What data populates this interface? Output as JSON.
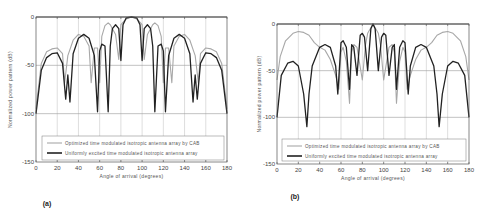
{
  "chart_data": [
    {
      "type": "line",
      "panel_label": "(a)",
      "title": "",
      "xlabel": "Angle of arrival (degrees)",
      "ylabel": "Normalized power pattern (dB)",
      "xlim": [
        0,
        180
      ],
      "ylim": [
        -150,
        0
      ],
      "xticks": [
        0,
        20,
        40,
        60,
        80,
        100,
        120,
        140,
        160,
        180
      ],
      "yticks": [
        0,
        -50,
        -100,
        -150
      ],
      "grid": true,
      "legend_position": "bottom",
      "series": [
        {
          "name": "Optimized time modulated isotropic antenna array by CAB",
          "color": "#a8a8a8",
          "x": [
            0,
            5,
            10,
            15,
            20,
            25,
            27,
            30,
            35,
            40,
            45,
            50,
            52,
            55,
            58,
            60,
            62,
            65,
            68,
            70,
            75,
            78,
            80,
            85,
            90,
            95,
            100,
            102,
            105,
            110,
            112,
            115,
            118,
            120,
            122,
            125,
            128,
            130,
            135,
            140,
            145,
            150,
            153,
            155,
            160,
            165,
            170,
            175,
            180
          ],
          "y": [
            -95,
            -48,
            -36,
            -33,
            -32,
            -38,
            -68,
            -40,
            -24,
            -18,
            -20,
            -30,
            -68,
            -32,
            -32,
            -68,
            -20,
            -9,
            -6,
            -8,
            -18,
            -44,
            -8,
            -2,
            0,
            -2,
            -8,
            -44,
            -18,
            -8,
            -6,
            -9,
            -20,
            -68,
            -32,
            -32,
            -68,
            -30,
            -20,
            -18,
            -24,
            -40,
            -68,
            -38,
            -32,
            -33,
            -36,
            -48,
            -95
          ]
        },
        {
          "name": "Uniformly excited time modulated isotropic antenna array",
          "color": "#222222",
          "x": [
            0,
            5,
            10,
            15,
            20,
            25,
            28,
            30,
            32,
            35,
            40,
            45,
            50,
            55,
            58,
            60,
            62,
            65,
            68,
            70,
            72,
            75,
            78,
            80,
            82,
            85,
            90,
            95,
            98,
            100,
            102,
            105,
            108,
            110,
            112,
            115,
            118,
            120,
            122,
            125,
            130,
            135,
            140,
            145,
            148,
            150,
            152,
            155,
            160,
            165,
            170,
            175,
            180
          ],
          "y": [
            -100,
            -55,
            -42,
            -38,
            -37,
            -48,
            -85,
            -60,
            -88,
            -38,
            -22,
            -18,
            -22,
            -40,
            -98,
            -35,
            -28,
            -30,
            -98,
            -30,
            -12,
            -8,
            -12,
            -45,
            -8,
            -1,
            0,
            -1,
            -8,
            -45,
            -12,
            -8,
            -12,
            -30,
            -98,
            -30,
            -28,
            -35,
            -98,
            -40,
            -22,
            -18,
            -22,
            -38,
            -88,
            -60,
            -85,
            -48,
            -37,
            -38,
            -42,
            -55,
            -100
          ]
        }
      ]
    },
    {
      "type": "line",
      "panel_label": "(b)",
      "title": "",
      "xlabel": "Angle of arrival (degrees)",
      "ylabel": "Normalized power pattern (dB)",
      "xlim": [
        0,
        180
      ],
      "ylim": [
        -150,
        0
      ],
      "xticks": [
        0,
        20,
        40,
        60,
        80,
        100,
        120,
        140,
        160,
        180
      ],
      "yticks": [
        0,
        -50,
        -100,
        -150
      ],
      "grid": true,
      "legend_position": "bottom",
      "series": [
        {
          "name": "Optimized time modulated isotropic antenna array by CAB",
          "color": "#a8a8a8",
          "x": [
            0,
            3,
            8,
            15,
            20,
            25,
            30,
            35,
            40,
            45,
            50,
            55,
            58,
            60,
            62,
            65,
            68,
            70,
            72,
            75,
            80,
            83,
            85,
            88,
            90,
            92,
            95,
            97,
            100,
            105,
            108,
            110,
            112,
            115,
            118,
            120,
            122,
            125,
            130,
            135,
            140,
            145,
            150,
            155,
            160,
            165,
            172,
            177,
            180
          ],
          "y": [
            -60,
            -35,
            -18,
            -10,
            -8,
            -9,
            -12,
            -20,
            -25,
            -28,
            -38,
            -55,
            -70,
            -30,
            -25,
            -40,
            -85,
            -30,
            -22,
            -25,
            -60,
            -22,
            -10,
            -4,
            0,
            -4,
            -10,
            -22,
            -60,
            -25,
            -22,
            -30,
            -85,
            -40,
            -25,
            -30,
            -70,
            -55,
            -38,
            -28,
            -25,
            -20,
            -12,
            -9,
            -8,
            -10,
            -18,
            -35,
            -60
          ]
        },
        {
          "name": "Uniformly excited time modulated isotropic antenna array",
          "color": "#222222",
          "x": [
            0,
            4,
            10,
            15,
            20,
            25,
            28,
            30,
            33,
            40,
            45,
            50,
            55,
            57,
            60,
            62,
            65,
            68,
            70,
            72,
            75,
            78,
            80,
            82,
            85,
            88,
            90,
            92,
            95,
            98,
            100,
            102,
            105,
            108,
            110,
            112,
            115,
            118,
            120,
            123,
            125,
            130,
            135,
            140,
            147,
            150,
            152,
            155,
            160,
            165,
            170,
            176,
            180
          ],
          "y": [
            -100,
            -55,
            -42,
            -40,
            -45,
            -75,
            -110,
            -75,
            -45,
            -25,
            -22,
            -25,
            -45,
            -75,
            -20,
            -18,
            -25,
            -70,
            -22,
            -25,
            -55,
            -12,
            -10,
            -14,
            -50,
            -5,
            0,
            -5,
            -50,
            -14,
            -10,
            -12,
            -55,
            -25,
            -22,
            -70,
            -25,
            -18,
            -20,
            -75,
            -45,
            -25,
            -22,
            -25,
            -45,
            -75,
            -110,
            -75,
            -45,
            -40,
            -42,
            -55,
            -100
          ]
        }
      ]
    }
  ]
}
